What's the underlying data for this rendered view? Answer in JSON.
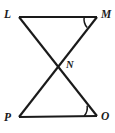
{
  "figure": {
    "kind": "geometry-diagram",
    "background_color": "#ffffff",
    "stroke_color": "#1a1a1a",
    "stroke_width": 2.1,
    "width": 115,
    "height": 133,
    "vertices": [
      {
        "id": "L",
        "label": "L",
        "x": 19,
        "y": 17
      },
      {
        "id": "M",
        "label": "M",
        "x": 97,
        "y": 17
      },
      {
        "id": "N",
        "label": "N",
        "x": 58,
        "y": 66
      },
      {
        "id": "P",
        "label": "P",
        "x": 19,
        "y": 117
      },
      {
        "id": "O",
        "label": "O",
        "x": 97,
        "y": 116
      }
    ],
    "segments": [
      {
        "id": "LM",
        "from": "L",
        "to": "M"
      },
      {
        "id": "PO",
        "from": "P",
        "to": "O"
      },
      {
        "id": "LO",
        "from": "L",
        "to": "O"
      },
      {
        "id": "PM",
        "from": "P",
        "to": "M"
      }
    ],
    "angle_marks": [
      {
        "id": "angle-M",
        "vertex": "M",
        "ray_a": "L",
        "ray_b": "P",
        "radius": 13
      },
      {
        "id": "angle-O",
        "vertex": "O",
        "ray_a": "P",
        "ray_b": "L",
        "radius": 13
      }
    ]
  }
}
